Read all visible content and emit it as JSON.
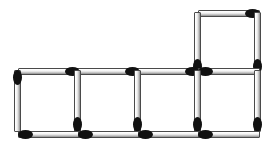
{
  "scene": {
    "title": "Matchstick Puzzle",
    "description": "Five squares formed from matchsticks: four squares in a row with a fifth square stacked above the rightmost square",
    "canvas": {
      "width": 278,
      "height": 152
    },
    "background_color": "#ffffff",
    "match": {
      "length": 62,
      "thickness": 7,
      "body_color": "#e2e2e2",
      "outline_color": "#4a4a4a",
      "head_color": "#111111",
      "head_length": 15,
      "head_width": 9
    },
    "square_size": 62,
    "squares": [
      {
        "name": "square-1",
        "row": "bottom",
        "column": 1,
        "x": 17,
        "y": 69
      },
      {
        "name": "square-2",
        "row": "bottom",
        "column": 2,
        "x": 77,
        "y": 69
      },
      {
        "name": "square-3",
        "row": "bottom",
        "column": 3,
        "x": 137,
        "y": 69
      },
      {
        "name": "square-4",
        "row": "bottom",
        "column": 4,
        "x": 197,
        "y": 69
      },
      {
        "name": "square-5",
        "row": "top",
        "column": 4,
        "x": 197,
        "y": 11
      }
    ],
    "counts": {
      "matches": 16,
      "squares": 5
    },
    "matches": [
      {
        "name": "match-top-square-top",
        "orientation": "horizontal",
        "x": 198,
        "y": 10,
        "head": "right"
      },
      {
        "name": "match-top-square-left",
        "orientation": "vertical",
        "x": 194,
        "y": 12,
        "head": "bottom"
      },
      {
        "name": "match-top-square-right",
        "orientation": "vertical",
        "x": 254,
        "y": 12,
        "head": "bottom"
      },
      {
        "name": "match-row-top-1",
        "orientation": "horizontal",
        "x": 18,
        "y": 68,
        "head": "right"
      },
      {
        "name": "match-row-top-2",
        "orientation": "horizontal",
        "x": 78,
        "y": 68,
        "head": "right"
      },
      {
        "name": "match-row-top-3",
        "orientation": "horizontal",
        "x": 138,
        "y": 68,
        "head": "right"
      },
      {
        "name": "match-row-top-4",
        "orientation": "horizontal",
        "x": 198,
        "y": 68,
        "head": "left"
      },
      {
        "name": "match-vertical-1",
        "orientation": "vertical",
        "x": 14,
        "y": 70,
        "head": "top"
      },
      {
        "name": "match-vertical-2",
        "orientation": "vertical",
        "x": 74,
        "y": 70,
        "head": "bottom"
      },
      {
        "name": "match-vertical-3",
        "orientation": "vertical",
        "x": 134,
        "y": 70,
        "head": "bottom"
      },
      {
        "name": "match-vertical-4",
        "orientation": "vertical",
        "x": 194,
        "y": 70,
        "head": "bottom"
      },
      {
        "name": "match-vertical-5",
        "orientation": "vertical",
        "x": 254,
        "y": 70,
        "head": "bottom"
      },
      {
        "name": "match-row-bottom-1",
        "orientation": "horizontal",
        "x": 18,
        "y": 131,
        "head": "left"
      },
      {
        "name": "match-row-bottom-2",
        "orientation": "horizontal",
        "x": 78,
        "y": 131,
        "head": "left"
      },
      {
        "name": "match-row-bottom-3",
        "orientation": "horizontal",
        "x": 138,
        "y": 131,
        "head": "left"
      },
      {
        "name": "match-row-bottom-4",
        "orientation": "horizontal",
        "x": 198,
        "y": 131,
        "head": "left"
      }
    ]
  }
}
